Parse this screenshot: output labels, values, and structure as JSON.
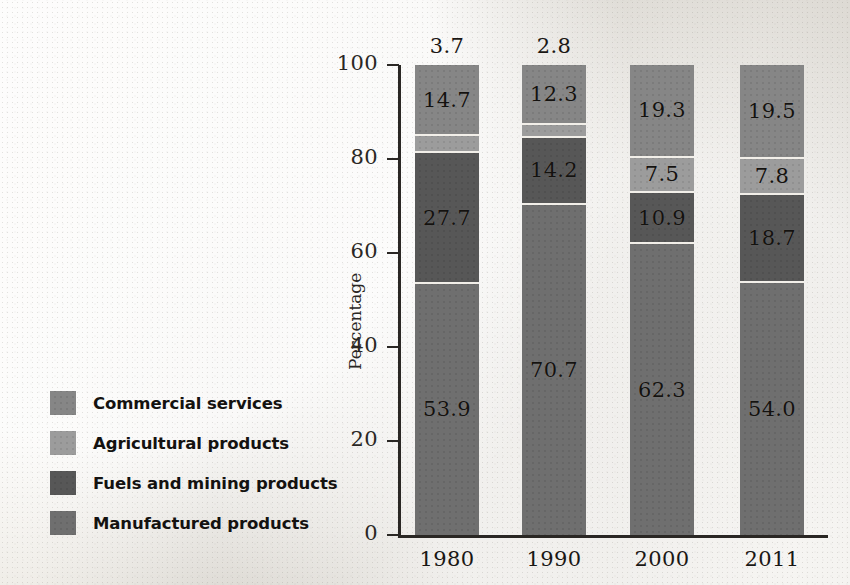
{
  "chart_data": {
    "type": "bar",
    "subtype": "stacked-100-percent",
    "title": "",
    "xlabel": "",
    "ylabel": "Percentage",
    "categories": [
      "1980",
      "1990",
      "2000",
      "2011"
    ],
    "ylim": [
      0,
      100
    ],
    "yticks": [
      "0",
      "20",
      "40",
      "60",
      "80",
      "100"
    ],
    "grid": false,
    "legend_position": "left",
    "stack_order_bottom_to_top": [
      "Manufactured products",
      "Fuels and mining products",
      "Agricultural products",
      "Commercial services"
    ],
    "series": [
      {
        "name": "Manufactured products",
        "color": "#6f6f6f",
        "values": [
          53.9,
          70.7,
          62.3,
          54.0
        ],
        "labels": [
          "53.9",
          "70.7",
          "62.3",
          "54.0"
        ]
      },
      {
        "name": "Fuels and mining products",
        "color": "#575757",
        "values": [
          27.7,
          14.2,
          10.9,
          18.7
        ],
        "labels": [
          "27.7",
          "14.2",
          "10.9",
          "18.7"
        ]
      },
      {
        "name": "Agricultural products",
        "color": "#9c9c9c",
        "values": [
          3.7,
          2.8,
          7.5,
          7.8
        ],
        "labels": [
          "3.7",
          "2.8",
          "7.5",
          "7.8"
        ]
      },
      {
        "name": "Commercial services",
        "color": "#868686",
        "values": [
          14.7,
          12.3,
          19.3,
          19.5
        ],
        "labels": [
          "14.7",
          "12.3",
          "19.3",
          "19.5"
        ]
      }
    ]
  },
  "axis": {
    "y_label": "Percentage",
    "y_ticks": [
      "100",
      "80",
      "60",
      "40",
      "20",
      "0"
    ],
    "x_ticks": [
      "1980",
      "1990",
      "2000",
      "2011"
    ]
  },
  "legend": {
    "items": [
      {
        "label": "Commercial services",
        "color": "#868686"
      },
      {
        "label": "Agricultural products",
        "color": "#9c9c9c"
      },
      {
        "label": "Fuels and mining products",
        "color": "#575757"
      },
      {
        "label": "Manufactured products",
        "color": "#6f6f6f"
      }
    ]
  },
  "bars": [
    {
      "year": "1980",
      "outside_label": "3.7",
      "segments": [
        {
          "name": "Commercial services",
          "value": 14.7,
          "label": "14.7",
          "show_label": true
        },
        {
          "name": "Agricultural products",
          "value": 3.7,
          "label": "3.7",
          "show_label": false
        },
        {
          "name": "Fuels and mining products",
          "value": 27.7,
          "label": "27.7",
          "show_label": true
        },
        {
          "name": "Manufactured products",
          "value": 53.9,
          "label": "53.9",
          "show_label": true
        }
      ]
    },
    {
      "year": "1990",
      "outside_label": "2.8",
      "segments": [
        {
          "name": "Commercial services",
          "value": 12.3,
          "label": "12.3",
          "show_label": true
        },
        {
          "name": "Agricultural products",
          "value": 2.8,
          "label": "2.8",
          "show_label": false
        },
        {
          "name": "Fuels and mining products",
          "value": 14.2,
          "label": "14.2",
          "show_label": true
        },
        {
          "name": "Manufactured products",
          "value": 70.7,
          "label": "70.7",
          "show_label": true
        }
      ]
    },
    {
      "year": "2000",
      "outside_label": "",
      "segments": [
        {
          "name": "Commercial services",
          "value": 19.3,
          "label": "19.3",
          "show_label": true
        },
        {
          "name": "Agricultural products",
          "value": 7.5,
          "label": "7.5",
          "show_label": true
        },
        {
          "name": "Fuels and mining products",
          "value": 10.9,
          "label": "10.9",
          "show_label": true
        },
        {
          "name": "Manufactured products",
          "value": 62.3,
          "label": "62.3",
          "show_label": true
        }
      ]
    },
    {
      "year": "2011",
      "outside_label": "",
      "segments": [
        {
          "name": "Commercial services",
          "value": 19.5,
          "label": "19.5",
          "show_label": true
        },
        {
          "name": "Agricultural products",
          "value": 7.8,
          "label": "7.8",
          "show_label": true
        },
        {
          "name": "Fuels and mining products",
          "value": 18.7,
          "label": "18.7",
          "show_label": true
        },
        {
          "name": "Manufactured products",
          "value": 54.0,
          "label": "54.0",
          "show_label": true
        }
      ]
    }
  ],
  "geometry": {
    "plot_top": 65,
    "plot_bottom": 535,
    "axis_x": 398,
    "bar_width": 64,
    "bar_lefts": [
      415,
      522,
      630,
      740
    ]
  }
}
